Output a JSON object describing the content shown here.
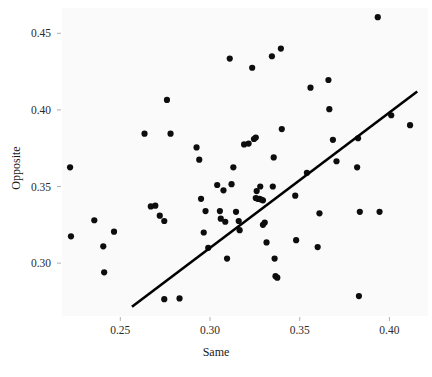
{
  "chart_data": {
    "type": "scatter",
    "title": "",
    "xlabel": "Same",
    "ylabel": "Opposite",
    "xlim": [
      0.2175,
      0.4215
    ],
    "ylim": [
      0.2655,
      0.4665
    ],
    "grid": false,
    "legend": null,
    "xticks": [
      0.25,
      0.3,
      0.35,
      0.4
    ],
    "xticklabels": [
      "0.25",
      "0.30",
      "0.35",
      "0.40"
    ],
    "yticks": [
      0.3,
      0.35,
      0.4,
      0.45
    ],
    "yticklabels": [
      "0.30",
      "0.35",
      "0.40",
      "0.45"
    ],
    "marker": "circle",
    "marker_color": "#0d0d0d",
    "marker_size": 3.1,
    "background_color": "#fafafa",
    "fit_line": {
      "label": "regression line",
      "color": "#000000",
      "width": 2.6,
      "x": [
        0.2565,
        0.4155
      ],
      "y": [
        0.2715,
        0.412
      ]
    },
    "points": [
      {
        "x": 0.222,
        "y": 0.3625
      },
      {
        "x": 0.2225,
        "y": 0.3175
      },
      {
        "x": 0.2355,
        "y": 0.328
      },
      {
        "x": 0.2405,
        "y": 0.311
      },
      {
        "x": 0.241,
        "y": 0.294
      },
      {
        "x": 0.2465,
        "y": 0.3205
      },
      {
        "x": 0.2635,
        "y": 0.3845
      },
      {
        "x": 0.267,
        "y": 0.337
      },
      {
        "x": 0.2695,
        "y": 0.3375
      },
      {
        "x": 0.272,
        "y": 0.331
      },
      {
        "x": 0.2745,
        "y": 0.3275
      },
      {
        "x": 0.276,
        "y": 0.4065
      },
      {
        "x": 0.278,
        "y": 0.3845
      },
      {
        "x": 0.2745,
        "y": 0.2765
      },
      {
        "x": 0.283,
        "y": 0.277
      },
      {
        "x": 0.2925,
        "y": 0.3755
      },
      {
        "x": 0.294,
        "y": 0.3675
      },
      {
        "x": 0.295,
        "y": 0.342
      },
      {
        "x": 0.2975,
        "y": 0.334
      },
      {
        "x": 0.2965,
        "y": 0.32
      },
      {
        "x": 0.299,
        "y": 0.31
      },
      {
        "x": 0.304,
        "y": 0.351
      },
      {
        "x": 0.3055,
        "y": 0.334
      },
      {
        "x": 0.306,
        "y": 0.329
      },
      {
        "x": 0.3075,
        "y": 0.3475
      },
      {
        "x": 0.3085,
        "y": 0.327
      },
      {
        "x": 0.3095,
        "y": 0.303
      },
      {
        "x": 0.311,
        "y": 0.4335
      },
      {
        "x": 0.312,
        "y": 0.3515
      },
      {
        "x": 0.313,
        "y": 0.3625
      },
      {
        "x": 0.3145,
        "y": 0.3335
      },
      {
        "x": 0.316,
        "y": 0.3275
      },
      {
        "x": 0.3165,
        "y": 0.3215
      },
      {
        "x": 0.319,
        "y": 0.3775
      },
      {
        "x": 0.3215,
        "y": 0.378
      },
      {
        "x": 0.3235,
        "y": 0.4275
      },
      {
        "x": 0.3245,
        "y": 0.381
      },
      {
        "x": 0.3255,
        "y": 0.382
      },
      {
        "x": 0.326,
        "y": 0.347
      },
      {
        "x": 0.3255,
        "y": 0.3425
      },
      {
        "x": 0.3265,
        "y": 0.342
      },
      {
        "x": 0.3275,
        "y": 0.342
      },
      {
        "x": 0.3285,
        "y": 0.3415
      },
      {
        "x": 0.3295,
        "y": 0.341
      },
      {
        "x": 0.328,
        "y": 0.35
      },
      {
        "x": 0.3295,
        "y": 0.325
      },
      {
        "x": 0.3305,
        "y": 0.3265
      },
      {
        "x": 0.3315,
        "y": 0.3135
      },
      {
        "x": 0.335,
        "y": 0.35
      },
      {
        "x": 0.3355,
        "y": 0.369
      },
      {
        "x": 0.3345,
        "y": 0.435
      },
      {
        "x": 0.336,
        "y": 0.303
      },
      {
        "x": 0.3365,
        "y": 0.2915
      },
      {
        "x": 0.3375,
        "y": 0.2905
      },
      {
        "x": 0.3395,
        "y": 0.44
      },
      {
        "x": 0.34,
        "y": 0.3875
      },
      {
        "x": 0.3475,
        "y": 0.344
      },
      {
        "x": 0.348,
        "y": 0.315
      },
      {
        "x": 0.354,
        "y": 0.359
      },
      {
        "x": 0.356,
        "y": 0.4145
      },
      {
        "x": 0.361,
        "y": 0.3325
      },
      {
        "x": 0.36,
        "y": 0.3105
      },
      {
        "x": 0.366,
        "y": 0.4195
      },
      {
        "x": 0.3665,
        "y": 0.4005
      },
      {
        "x": 0.3685,
        "y": 0.3805
      },
      {
        "x": 0.3705,
        "y": 0.3665
      },
      {
        "x": 0.382,
        "y": 0.3625
      },
      {
        "x": 0.3825,
        "y": 0.3815
      },
      {
        "x": 0.3835,
        "y": 0.3335
      },
      {
        "x": 0.383,
        "y": 0.2785
      },
      {
        "x": 0.3935,
        "y": 0.4605
      },
      {
        "x": 0.3945,
        "y": 0.3335
      },
      {
        "x": 0.401,
        "y": 0.3965
      },
      {
        "x": 0.4115,
        "y": 0.39
      }
    ]
  }
}
